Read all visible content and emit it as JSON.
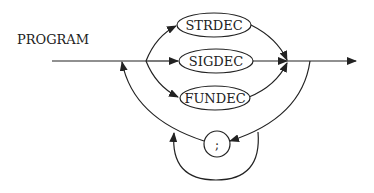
{
  "diagram": {
    "type": "syntax-diagram",
    "title": "PROGRAM",
    "nodes": [
      {
        "id": "strdec",
        "label": "STRDEC"
      },
      {
        "id": "sigdec",
        "label": "SIGDEC"
      },
      {
        "id": "fundec",
        "label": "FUNDEC"
      },
      {
        "id": "semicolon",
        "label": ";"
      }
    ],
    "edges": [
      {
        "from": "start",
        "to": "strdec"
      },
      {
        "from": "start",
        "to": "sigdec"
      },
      {
        "from": "start",
        "to": "fundec"
      },
      {
        "from": "strdec",
        "to": "end"
      },
      {
        "from": "sigdec",
        "to": "end"
      },
      {
        "from": "fundec",
        "to": "end"
      },
      {
        "from": "end",
        "to": "start",
        "via": "loop-back"
      },
      {
        "from": "end",
        "to": "semicolon"
      },
      {
        "from": "semicolon",
        "to": "start"
      },
      {
        "from": "end",
        "to": "start",
        "via": "semicolon-bypass"
      }
    ]
  }
}
